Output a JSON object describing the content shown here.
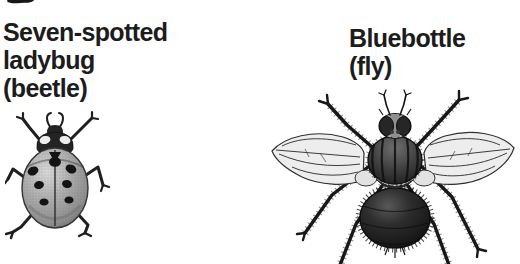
{
  "figure": {
    "background_color": "#ffffff",
    "ink_color": "#1c1c1c",
    "specimens": [
      {
        "id": "seven-spotted-ladybug",
        "label_line1": "Seven-spotted",
        "label_line2": "ladybug",
        "label_line3": "(beetle)",
        "illustration": "seven-spotted-ladybug-engraving"
      },
      {
        "id": "bluebottle-fly",
        "label_line1": "Bluebottle",
        "label_line2": "(fly)",
        "illustration": "bluebottle-fly-engraving"
      }
    ]
  }
}
